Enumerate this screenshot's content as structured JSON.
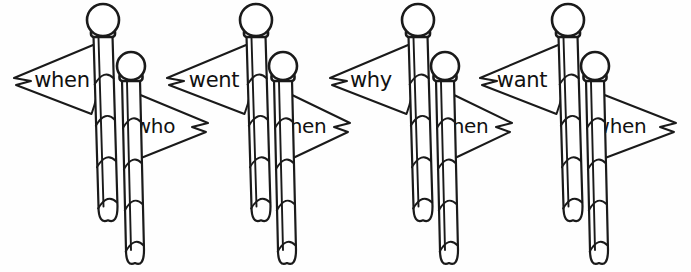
{
  "worksheet": {
    "title": "Flag word pairs",
    "description": "Four pairs of striped flagpoles with ball finials; each pair shows a left-pointing pennant on the tall pole and a right-pointing pennant on the short pole, each bearing a question word.",
    "ink_color": "#1a1a1a",
    "background_color": "#fefefe",
    "paper_color": "#ffffff"
  },
  "groups": [
    {
      "id": "group-1",
      "tall_pole": {
        "name": "tall-flagpole",
        "ball_x": 103,
        "ball_y": 20,
        "ball_r": 16,
        "pole_top": 36,
        "pole_bottom": 216,
        "pole_width": 19,
        "lean": 5
      },
      "short_pole": {
        "name": "short-flagpole",
        "ball_x": 131,
        "ball_y": 66,
        "ball_r": 14,
        "pole_top": 80,
        "pole_bottom": 259,
        "pole_width": 18,
        "lean": 4
      },
      "left_flag": {
        "word": "when",
        "tip_x": 14,
        "mid_y": 80,
        "text_x": 62,
        "text_y": 87
      },
      "right_flag": {
        "word": "who",
        "tip_x": 208,
        "mid_y": 126,
        "text_x": 155,
        "text_y": 133
      }
    },
    {
      "id": "group-2",
      "tall_pole": {
        "name": "tall-flagpole",
        "ball_x": 256,
        "ball_y": 20,
        "ball_r": 16,
        "pole_top": 36,
        "pole_bottom": 216,
        "pole_width": 19,
        "lean": 5
      },
      "short_pole": {
        "name": "short-flagpole",
        "ball_x": 283,
        "ball_y": 66,
        "ball_r": 14,
        "pole_top": 80,
        "pole_bottom": 259,
        "pole_width": 18,
        "lean": 4
      },
      "left_flag": {
        "word": "went",
        "tip_x": 167,
        "mid_y": 80,
        "text_x": 214,
        "text_y": 87
      },
      "right_flag": {
        "word": "when",
        "tip_x": 350,
        "mid_y": 126,
        "text_x": 300,
        "text_y": 133
      }
    },
    {
      "id": "group-3",
      "tall_pole": {
        "name": "tall-flagpole",
        "ball_x": 418,
        "ball_y": 20,
        "ball_r": 16,
        "pole_top": 36,
        "pole_bottom": 216,
        "pole_width": 19,
        "lean": 5
      },
      "short_pole": {
        "name": "short-flagpole",
        "ball_x": 445,
        "ball_y": 66,
        "ball_r": 14,
        "pole_top": 80,
        "pole_bottom": 259,
        "pole_width": 18,
        "lean": 4
      },
      "left_flag": {
        "word": "why",
        "tip_x": 330,
        "mid_y": 80,
        "text_x": 371,
        "text_y": 87
      },
      "right_flag": {
        "word": "when",
        "tip_x": 512,
        "mid_y": 126,
        "text_x": 462,
        "text_y": 133
      }
    },
    {
      "id": "group-4",
      "tall_pole": {
        "name": "tall-flagpole",
        "ball_x": 568,
        "ball_y": 20,
        "ball_r": 16,
        "pole_top": 36,
        "pole_bottom": 216,
        "pole_width": 19,
        "lean": 5
      },
      "short_pole": {
        "name": "short-flagpole",
        "ball_x": 595,
        "ball_y": 66,
        "ball_r": 14,
        "pole_top": 80,
        "pole_bottom": 259,
        "pole_width": 18,
        "lean": 4
      },
      "left_flag": {
        "word": "want",
        "tip_x": 480,
        "mid_y": 80,
        "text_x": 522,
        "text_y": 87
      },
      "right_flag": {
        "word": "when",
        "tip_x": 676,
        "mid_y": 126,
        "text_x": 620,
        "text_y": 133
      }
    }
  ]
}
